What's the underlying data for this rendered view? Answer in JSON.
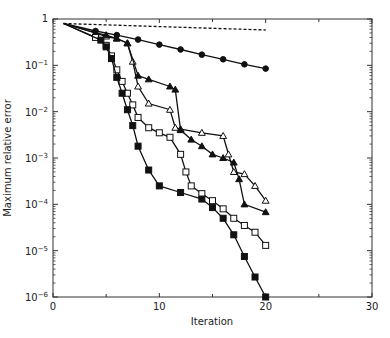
{
  "chart_data": {
    "type": "line",
    "title": "",
    "xlabel": "Iteration",
    "ylabel": "Maximum relative error",
    "xlim": [
      0,
      30
    ],
    "ylim": [
      1e-06,
      1
    ],
    "yscale": "log",
    "grid": false,
    "legend": null,
    "xticks": [
      0,
      10,
      20,
      30
    ],
    "xtick_labels": [
      "0",
      "10",
      "20",
      "30"
    ],
    "yticks": [
      1,
      0.1,
      0.01,
      0.001,
      0.0001,
      1e-05,
      1e-06
    ],
    "ytick_labels": [
      {
        "base": "1",
        "exp": ""
      },
      {
        "base": "10",
        "exp": "−1"
      },
      {
        "base": "10",
        "exp": "−2"
      },
      {
        "base": "10",
        "exp": "−3"
      },
      {
        "base": "10",
        "exp": "−4"
      },
      {
        "base": "10",
        "exp": "−5"
      },
      {
        "base": "10",
        "exp": "−6"
      }
    ],
    "series": [
      {
        "name": "reference (dashed)",
        "marker": "none",
        "linestyle": "dashed",
        "x": [
          1,
          20
        ],
        "y": [
          0.8,
          0.58
        ]
      },
      {
        "name": "filled circles",
        "marker": "circle-filled",
        "linestyle": "solid",
        "x": [
          1,
          4,
          6,
          8,
          10,
          12,
          14,
          16,
          18,
          20
        ],
        "y": [
          0.8,
          0.55,
          0.45,
          0.36,
          0.28,
          0.22,
          0.17,
          0.135,
          0.105,
          0.085
        ]
      },
      {
        "name": "open triangles",
        "marker": "triangle-open",
        "linestyle": "solid",
        "x": [
          1,
          4,
          5,
          6,
          7,
          7.5,
          8,
          9,
          11,
          11.5,
          12,
          14,
          16,
          16.5,
          17,
          18,
          19,
          20
        ],
        "y": [
          0.8,
          0.5,
          0.42,
          0.38,
          0.3,
          0.12,
          0.035,
          0.015,
          0.011,
          0.0045,
          0.0042,
          0.0035,
          0.003,
          0.0012,
          0.0005,
          0.00045,
          0.00025,
          0.00012
        ]
      },
      {
        "name": "filled triangles",
        "marker": "triangle-filled",
        "linestyle": "solid",
        "x": [
          1,
          4,
          5,
          6,
          7,
          8,
          9,
          11,
          11.5,
          12,
          13,
          14,
          15,
          16,
          17,
          17.5,
          18,
          20
        ],
        "y": [
          0.8,
          0.5,
          0.45,
          0.38,
          0.3,
          0.06,
          0.05,
          0.035,
          0.03,
          0.004,
          0.0025,
          0.0018,
          0.0012,
          0.001,
          0.0008,
          0.00035,
          0.0001,
          6.8e-05
        ]
      },
      {
        "name": "open squares",
        "marker": "square-open",
        "linestyle": "solid",
        "x": [
          1,
          4,
          5,
          5.5,
          6,
          6.5,
          7,
          7.5,
          8,
          9,
          10,
          11,
          12,
          12.5,
          13,
          14,
          15,
          16,
          17,
          18,
          19,
          20
        ],
        "y": [
          0.8,
          0.4,
          0.27,
          0.16,
          0.08,
          0.045,
          0.025,
          0.014,
          0.0075,
          0.0045,
          0.0035,
          0.0028,
          0.0012,
          0.0005,
          0.00025,
          0.00017,
          0.00012,
          8e-05,
          5e-05,
          3.5e-05,
          2.5e-05,
          1.3e-05
        ]
      },
      {
        "name": "filled squares",
        "marker": "square-filled",
        "linestyle": "solid",
        "x": [
          1,
          4.5,
          5,
          5.5,
          6,
          6.5,
          7,
          7.5,
          8,
          9,
          10,
          12,
          14,
          15,
          16,
          17,
          18,
          19,
          20
        ],
        "y": [
          0.8,
          0.35,
          0.25,
          0.14,
          0.055,
          0.025,
          0.011,
          0.005,
          0.0018,
          0.00055,
          0.00025,
          0.00018,
          0.00013,
          8.5e-05,
          5e-05,
          2.2e-05,
          7.5e-06,
          2.7e-06,
          1e-06
        ]
      }
    ]
  }
}
